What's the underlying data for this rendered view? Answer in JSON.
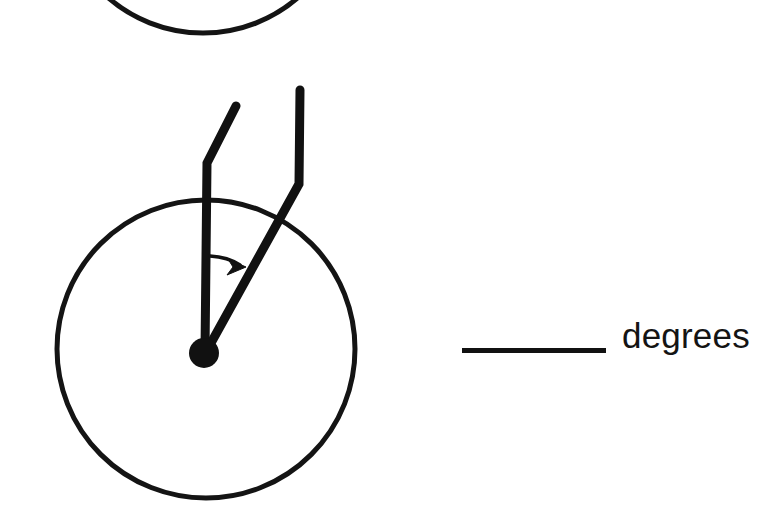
{
  "page": {
    "type": "angle-measurement-worksheet",
    "background_color": "#ffffff",
    "ink_color": "#111111",
    "width": 779,
    "height": 518
  },
  "answer": {
    "blank_value": "",
    "blank_placeholder": "",
    "unit_label": "degrees"
  },
  "figure": {
    "title": "",
    "partial_circle_above": {
      "name": "previous-problem-circle-arc",
      "center_x": 203,
      "center_y": -112,
      "radius": 145,
      "stroke_width": 5,
      "note": "bottom arc of a circle cropped by the top edge of the page"
    },
    "circle": {
      "name": "clock-face-circle",
      "center_x": 206,
      "center_y": 349,
      "radius": 149,
      "stroke_width": 5
    },
    "vertex": {
      "name": "angle-vertex-dot",
      "x": 204,
      "y": 353,
      "radius": 15
    },
    "rays": [
      {
        "name": "ray-vertical-up",
        "label": "first hand (12 o'clock direction)",
        "stroke_width": 9,
        "points": [
          [
            205,
            352
          ],
          [
            207,
            163
          ],
          [
            236,
            106
          ]
        ],
        "angle_degrees_from_up": 0
      },
      {
        "name": "ray-upper-right",
        "label": "second hand",
        "stroke_width": 9,
        "points": [
          [
            206,
            352
          ],
          [
            299,
            184
          ],
          [
            300,
            90
          ]
        ],
        "angle_degrees_from_up": 29
      }
    ],
    "angle_arrow": {
      "name": "angle-direction-arrow",
      "start_x": 210,
      "start_y": 256,
      "end_x": 243,
      "end_y": 267,
      "stroke_width": 3,
      "direction": "clockwise from vertical ray toward second ray"
    }
  }
}
